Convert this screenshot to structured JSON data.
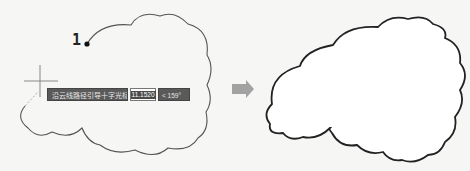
{
  "step_label": "1",
  "tooltip": {
    "prompt": "沿云线路径引导十字光标...",
    "input_value": "11.1520",
    "angle": "< 159°"
  },
  "colors": {
    "cloud_stroke_left": "#555555",
    "cloud_stroke_right": "#222222",
    "arrow": "#a0a0a0",
    "tooltip_bg": "#5a5a5a"
  },
  "icons": {
    "crosshair": "crosshair-cursor-icon",
    "arrow": "right-arrow-icon",
    "start_point": "start-point-dot-icon"
  }
}
